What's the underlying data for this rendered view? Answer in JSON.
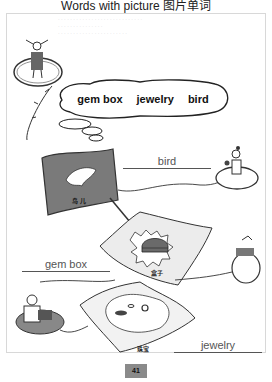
{
  "page": {
    "title": "Words with picture 图片单词",
    "page_number": "41"
  },
  "word_bank": {
    "words": [
      "gem box",
      "jewelry",
      "bird"
    ]
  },
  "pictures": [
    {
      "name": "bird-flag",
      "chinese_label": "鸟 儿",
      "answer": "bird"
    },
    {
      "name": "box-flag",
      "chinese_label": "盒子",
      "answer": "gem box"
    },
    {
      "name": "jewelry-flag",
      "chinese_label": "珠宝",
      "answer": "jewelry"
    }
  ],
  "colors": {
    "ink": "#111111",
    "answer_ink": "#555555",
    "flag_dark": "#7a7a7a",
    "flag_light": "#e8e8e8",
    "page_badge": "#8a8a8a"
  }
}
